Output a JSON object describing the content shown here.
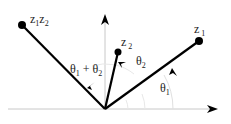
{
  "diagram": {
    "points": {
      "z1z2": {
        "label_main": "z",
        "sub1": "1",
        "mid": "z",
        "sub2": "2"
      },
      "z2": {
        "label_main": "z",
        "sub": "2"
      },
      "z1": {
        "label_main": "z",
        "sub": "1"
      }
    },
    "angles": {
      "theta1": {
        "symbol": "θ",
        "sub": "1"
      },
      "theta2": {
        "symbol": "θ",
        "sub": "2"
      },
      "theta_sum": {
        "symbol": "θ",
        "sub1": "1",
        "plus": " + ",
        "sub2": "2"
      }
    },
    "colors": {
      "vector": "#000000",
      "axis": "#bdbdbd",
      "arc": "#d9d9d9",
      "text": "#222222"
    }
  }
}
